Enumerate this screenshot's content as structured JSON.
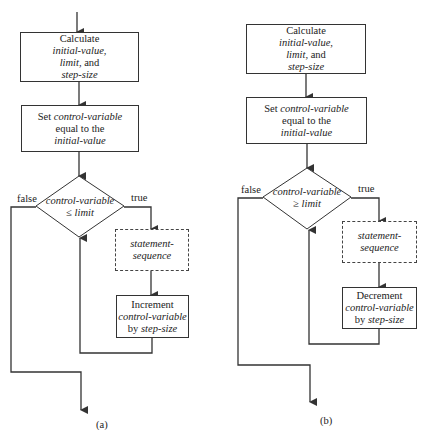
{
  "flowcharts": [
    {
      "id": "a",
      "caption": "(a)",
      "calc_box": {
        "l1": "Calculate",
        "l2": "initial-value,",
        "l3a": "limit,",
        "l3b": " and",
        "l4": "step-size"
      },
      "set_box": {
        "l1a": "Set ",
        "l1b": "control-variable",
        "l2": "equal to the",
        "l3": "initial-value"
      },
      "decision": {
        "l1": "control-variable",
        "l2": "≤ limit"
      },
      "false_label": "false",
      "true_label": "true",
      "body_box": {
        "l1": "statement-",
        "l2": "sequence"
      },
      "update_box": {
        "l1": "Increment",
        "l2": "control-variable",
        "l3a": "by ",
        "l3b": "step-size"
      }
    },
    {
      "id": "b",
      "caption": "(b)",
      "calc_box": {
        "l1": "Calculate",
        "l2": "initial-value,",
        "l3a": "limit,",
        "l3b": " and",
        "l4": "step-size"
      },
      "set_box": {
        "l1a": "Set ",
        "l1b": "control-variable",
        "l2": "equal to the",
        "l3": "initial-value"
      },
      "decision": {
        "l1": "control-variable",
        "l2": "≥ limit"
      },
      "false_label": "false",
      "true_label": "true",
      "body_box": {
        "l1": "statement-",
        "l2": "sequence"
      },
      "update_box": {
        "l1": "Decrement",
        "l2": "control-variable",
        "l3a": "by ",
        "l3b": "step-size"
      }
    }
  ]
}
